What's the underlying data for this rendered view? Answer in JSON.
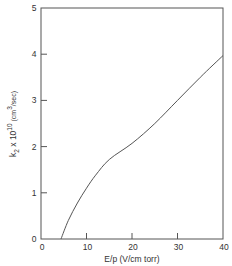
{
  "chart_data": {
    "type": "line",
    "title": "",
    "xlabel": "E/p (V/cm torr)",
    "ylabel": "k2 x 10^10 (cm^3/sec)",
    "ylabel_parts": {
      "base": "k",
      "sub": "2",
      "mult": " x 10",
      "exp": "10",
      "unit_open": " (cm",
      "unit_exp": "3",
      "unit_close": "/sec)"
    },
    "xlim": [
      0,
      40
    ],
    "ylim": [
      0,
      5
    ],
    "x_ticks": [
      0,
      10,
      20,
      30,
      40
    ],
    "y_ticks": [
      0,
      1,
      2,
      3,
      4,
      5
    ],
    "x_tick_labels": [
      "0",
      "10",
      "20",
      "30",
      "40"
    ],
    "y_tick_labels": [
      "0",
      "1",
      "2",
      "3",
      "4",
      "5"
    ],
    "grid": false,
    "legend": null,
    "series": [
      {
        "name": "k2",
        "x": [
          4.4,
          6,
          8,
          10,
          12,
          15,
          20,
          25,
          30,
          35,
          40
        ],
        "y": [
          0.0,
          0.4,
          0.78,
          1.1,
          1.38,
          1.72,
          2.07,
          2.5,
          3.0,
          3.5,
          3.97
        ]
      }
    ]
  }
}
